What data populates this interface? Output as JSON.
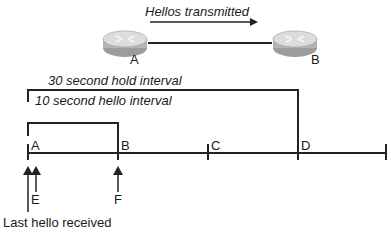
{
  "top": {
    "hellos_label": "Hellos transmitted",
    "router_a_label": "A",
    "router_b_label": "B"
  },
  "timeline": {
    "hold_interval_label": "30 second hold interval",
    "hello_interval_label": "10 second hello interval",
    "points": [
      {
        "label": "A",
        "x": 27
      },
      {
        "label": "B",
        "x": 118
      },
      {
        "label": "C",
        "x": 208
      },
      {
        "label": "D",
        "x": 298
      },
      {
        "label": "",
        "x": 386
      }
    ],
    "arrows": [
      {
        "label": "",
        "x": 27
      },
      {
        "label": "E",
        "x": 35
      },
      {
        "label": "F",
        "x": 118
      }
    ],
    "last_hello_label": "Last hello received"
  },
  "colors": {
    "line": "#222222",
    "router_top": "#d8d8d8",
    "router_side": "#a8a8a8"
  }
}
